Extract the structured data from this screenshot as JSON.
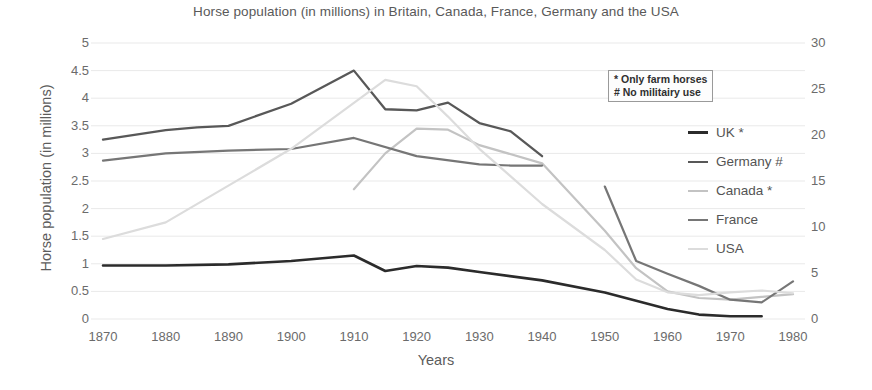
{
  "chart_data": {
    "type": "line",
    "title": "Horse population (in millions) in Britain, Canada, France, Germany and the USA",
    "xlabel": "Years",
    "ylabel": "Horse population (in millions)",
    "ylabel_right": "",
    "grid": true,
    "legend_position": "right",
    "xlim": [
      1870,
      1980
    ],
    "ylim": [
      0,
      5
    ],
    "ylim_right": [
      0,
      30
    ],
    "x_ticks": [
      1870,
      1880,
      1890,
      1900,
      1910,
      1920,
      1930,
      1940,
      1950,
      1960,
      1970,
      1980
    ],
    "y_ticks_left": [
      "0",
      "0.5",
      "1",
      "1.5",
      "2",
      "2.5",
      "3",
      "3.5",
      "4",
      "4.5",
      "5"
    ],
    "y_ticks_right": [
      "0",
      "5",
      "10",
      "15",
      "20",
      "25",
      "30"
    ],
    "notes": [
      "* Only farm horses",
      "# No militairy use"
    ],
    "series": [
      {
        "name": "UK *",
        "color": "#2b2b2b",
        "width": 2.6,
        "axis": "left",
        "x": [
          1870,
          1880,
          1890,
          1900,
          1905,
          1910,
          1915,
          1920,
          1925,
          1930,
          1940,
          1950,
          1955,
          1960,
          1965,
          1970,
          1975
        ],
        "values": [
          0.97,
          0.97,
          0.99,
          1.05,
          1.1,
          1.15,
          0.87,
          0.96,
          0.93,
          0.85,
          0.7,
          0.48,
          0.33,
          0.18,
          0.08,
          0.05,
          0.05
        ]
      },
      {
        "name": "Germany #",
        "color": "#585858",
        "width": 2.3,
        "axis": "left",
        "x": [
          1870,
          1880,
          1885,
          1890,
          1900,
          1910,
          1915,
          1920,
          1925,
          1930,
          1935,
          1940
        ],
        "values": [
          3.25,
          3.42,
          3.47,
          3.5,
          3.9,
          4.5,
          3.8,
          3.78,
          3.92,
          3.55,
          3.4,
          2.95
        ]
      },
      {
        "name": "Canada *",
        "color": "#c3c3c3",
        "width": 2.2,
        "axis": "left",
        "x": [
          1910,
          1915,
          1920,
          1925,
          1930,
          1940,
          1950,
          1955,
          1960,
          1965,
          1970,
          1975,
          1980
        ],
        "values": [
          2.35,
          3.0,
          3.45,
          3.43,
          3.15,
          2.82,
          1.6,
          0.92,
          0.5,
          0.38,
          0.35,
          0.4,
          0.45
        ]
      },
      {
        "name": "France",
        "color": "#767676",
        "width": 2.2,
        "axis": "left",
        "x": [
          1870,
          1880,
          1890,
          1900,
          1910,
          1920,
          1930,
          1935,
          1940
        ],
        "values": [
          2.87,
          3.0,
          3.05,
          3.08,
          3.28,
          2.95,
          2.8,
          2.78,
          2.78
        ],
        "segment2_x": [
          1950,
          1955,
          1960,
          1965,
          1970,
          1975,
          1980
        ],
        "segment2_values": [
          2.4,
          1.05,
          0.82,
          0.6,
          0.35,
          0.3,
          0.68
        ]
      },
      {
        "name": "USA",
        "color": "#dcdcdc",
        "width": 2.2,
        "axis": "right",
        "x": [
          1870,
          1880,
          1890,
          1900,
          1910,
          1915,
          1920,
          1925,
          1930,
          1940,
          1950,
          1955,
          1960,
          1965,
          1970,
          1975,
          1980
        ],
        "values": [
          8.7,
          10.5,
          14.5,
          18.5,
          23.5,
          26.0,
          25.3,
          22.0,
          18.5,
          12.5,
          7.5,
          4.3,
          2.9,
          2.6,
          2.9,
          3.1,
          2.8
        ]
      }
    ]
  },
  "legend": {
    "items": [
      {
        "label": "UK *",
        "color": "#2b2b2b",
        "width": 3
      },
      {
        "label": "Germany #",
        "color": "#585858",
        "width": 2.5
      },
      {
        "label": "Canada *",
        "color": "#c3c3c3",
        "width": 2.5
      },
      {
        "label": "France",
        "color": "#767676",
        "width": 2.5
      },
      {
        "label": "USA",
        "color": "#dcdcdc",
        "width": 2.5
      }
    ]
  }
}
